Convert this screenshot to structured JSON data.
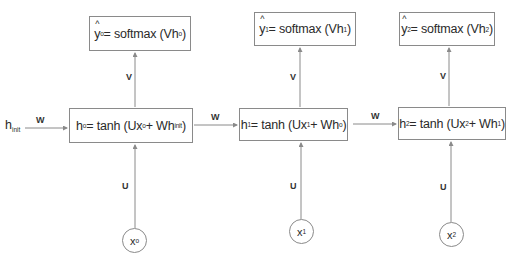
{
  "diagram": {
    "colors": {
      "line": "#8a8a8a",
      "text": "#2a2a2a",
      "background": "#ffffff"
    },
    "initial_state": {
      "symbol": "h",
      "subscript": "init"
    },
    "weight_labels": {
      "recurrent": "W",
      "output": "V",
      "input": "U"
    },
    "timesteps": [
      {
        "index": "0",
        "output": {
          "lhs": "y",
          "lhs_sub": "o",
          "eq": "= softmax (Vh",
          "arg_sub": "o",
          "close": ")"
        },
        "hidden": {
          "lhs": "h",
          "lhs_sub": "o",
          "eq": "= tanh (Ux",
          "x_sub": "o",
          "plus": " + Wh",
          "prev_sub": "init",
          "close": ")"
        },
        "input": {
          "symbol": "x",
          "sub": "o"
        }
      },
      {
        "index": "1",
        "output": {
          "lhs": "y",
          "lhs_sub": "1",
          "eq": "= softmax (Vh",
          "arg_sub": "1",
          "close": ")"
        },
        "hidden": {
          "lhs": "h",
          "lhs_sub": "1",
          "eq": "= tanh (Ux",
          "x_sub": "1",
          "plus": " + Wh",
          "prev_sub": "o",
          "close": ")"
        },
        "input": {
          "symbol": "x",
          "sub": "1"
        }
      },
      {
        "index": "2",
        "output": {
          "lhs": "y",
          "lhs_sub": "2",
          "eq": "= softmax (Vh",
          "arg_sub": "2",
          "close": ")"
        },
        "hidden": {
          "lhs": "h",
          "lhs_sub": "2",
          "eq": "= tanh (Ux",
          "x_sub": "2",
          "plus": " + Wh",
          "prev_sub": "1",
          "close": ")"
        },
        "input": {
          "symbol": "x",
          "sub": "2"
        }
      }
    ]
  }
}
